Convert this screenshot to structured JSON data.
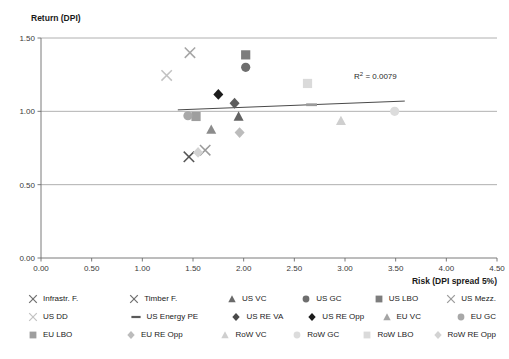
{
  "chart_data": {
    "type": "scatter",
    "title": "",
    "ylabel": "Return (DPI)",
    "xlabel": "Risk (DPI spread 5%)",
    "xlim": [
      0.0,
      4.5
    ],
    "ylim": [
      0.0,
      1.5
    ],
    "xticks": [
      "0.00",
      "0.50",
      "1.00",
      "1.50",
      "2.00",
      "2.50",
      "3.00",
      "3.50",
      "4.00",
      "4.50"
    ],
    "yticks": [
      "0.00",
      "0.50",
      "1.00",
      "1.50"
    ],
    "grid": true,
    "legend_position": "bottom",
    "annotations": [
      {
        "text": "R² = 0.0079",
        "x": 3.3,
        "y": 1.22
      }
    ],
    "trendline": {
      "x0": 1.35,
      "y0": 1.01,
      "x1": 3.59,
      "y1": 1.07,
      "color": "#4a4a4a"
    },
    "points": [
      {
        "name": "Infrastr. F.",
        "marker": "x-thin",
        "color": "#9a9a9a",
        "x": 1.62,
        "y": 0.735
      },
      {
        "name": "Timber F.",
        "marker": "x-thin",
        "color": "#555555",
        "x": 1.46,
        "y": 0.69
      },
      {
        "name": "US VC",
        "marker": "triangle",
        "color": "#8c8c8c",
        "x": 1.68,
        "y": 0.875
      },
      {
        "name": "US GC",
        "marker": "circle",
        "color": "#6e6e6e",
        "x": 2.02,
        "y": 1.3
      },
      {
        "name": "US LBO",
        "marker": "square",
        "color": "#7d7d7d",
        "x": 2.02,
        "y": 1.385
      },
      {
        "name": "US Mezz.",
        "marker": "x-thin",
        "color": "#a5a5a5",
        "x": 1.47,
        "y": 1.4
      },
      {
        "name": "US DD",
        "marker": "x-thin",
        "color": "#c2c2c2",
        "x": 1.24,
        "y": 1.245
      },
      {
        "name": "US Energy PE",
        "marker": "dash",
        "color": "#9a9a9a",
        "x": 2.67,
        "y": 1.045
      },
      {
        "name": "US RE VA",
        "marker": "diamond",
        "color": "#5e5e5e",
        "x": 1.91,
        "y": 1.055
      },
      {
        "name": "US RE Opp",
        "marker": "diamond",
        "color": "#1c1c1c",
        "x": 1.75,
        "y": 1.115
      },
      {
        "name": "EU LBO",
        "marker": "square",
        "color": "#9e9e9e",
        "x": 1.53,
        "y": 0.965
      },
      {
        "name": "EU VC",
        "marker": "triangle",
        "color": "#636363",
        "x": 1.95,
        "y": 0.965
      },
      {
        "name": "EU GC",
        "marker": "circle",
        "color": "#a8a8a8",
        "x": 1.45,
        "y": 0.97
      },
      {
        "name": "EU RE Opp",
        "marker": "diamond",
        "color": "#bcbcbc",
        "x": 1.96,
        "y": 0.855
      },
      {
        "name": "RoW VC",
        "marker": "triangle",
        "color": "#cfcfcf",
        "x": 2.96,
        "y": 0.935
      },
      {
        "name": "RoW GC",
        "marker": "circle",
        "color": "#dcdcdc",
        "x": 3.49,
        "y": 1.0
      },
      {
        "name": "RoW LBO",
        "marker": "square",
        "color": "#dadada",
        "x": 2.63,
        "y": 1.19
      },
      {
        "name": "RoW RE Opp",
        "marker": "diamond",
        "color": "#d3d3d3",
        "x": 1.55,
        "y": 0.72
      }
    ]
  },
  "legend": {
    "rows": [
      [
        {
          "label": "Infrastr. F.",
          "marker": "x-thin",
          "color": "#6f6f6f"
        },
        {
          "label": "Timber F.",
          "marker": "x-thin",
          "color": "#6f6f6f"
        },
        {
          "label": "US VC",
          "marker": "triangle",
          "color": "#6a6a6a"
        },
        {
          "label": "US GC",
          "marker": "circle",
          "color": "#6e6e6e"
        },
        {
          "label": "US LBO",
          "marker": "square",
          "color": "#7d7d7d"
        },
        {
          "label": "US Mezz.",
          "marker": "x-thin",
          "color": "#9a9a9a"
        }
      ],
      [
        {
          "label": "US DD",
          "marker": "x-thin",
          "color": "#c2c2c2"
        },
        {
          "label": "US Energy PE",
          "marker": "dash",
          "color": "#5a5a5a"
        },
        {
          "label": "US RE VA",
          "marker": "diamond",
          "color": "#4a4a4a"
        },
        {
          "label": "US RE Opp",
          "marker": "diamond",
          "color": "#1c1c1c"
        },
        {
          "label": "EU VC",
          "marker": "triangle",
          "color": "#a5a5a5"
        },
        {
          "label": "EU GC",
          "marker": "circle",
          "color": "#a8a8a8"
        }
      ],
      [
        {
          "label": "EU LBO",
          "marker": "square",
          "color": "#9e9e9e"
        },
        {
          "label": "EU RE Opp",
          "marker": "diamond",
          "color": "#bcbcbc"
        },
        {
          "label": "RoW VC",
          "marker": "triangle",
          "color": "#cfcfcf"
        },
        {
          "label": "RoW GC",
          "marker": "circle",
          "color": "#dcdcdc"
        },
        {
          "label": "RoW LBO",
          "marker": "square",
          "color": "#dadada"
        },
        {
          "label": "RoW RE Opp",
          "marker": "diamond",
          "color": "#d3d3d3"
        }
      ]
    ]
  },
  "colors": {
    "axis": "#6b6b6b",
    "grid": "#9c9c9c",
    "text": "#1a1a1a",
    "trend": "#4a4a4a"
  }
}
